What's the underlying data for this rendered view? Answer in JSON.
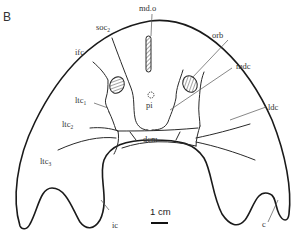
{
  "figure": {
    "panel_label": "B",
    "scale_bar": {
      "label": "1 cm"
    },
    "labels": {
      "md_o": "md.o",
      "soc": "soc",
      "soc_sub": "2",
      "ifc": "ifc",
      "orb": "orb",
      "mdc": "mdc",
      "pi": "pi",
      "ltc1": "ltc",
      "ltc1_sub": "1",
      "ltc2": "ltc",
      "ltc2_sub": "2",
      "ltc3": "ltc",
      "ltc3_sub": "3",
      "ldc": "ldc",
      "dcm": "dcm",
      "ic": "ic",
      "c": "c"
    }
  }
}
